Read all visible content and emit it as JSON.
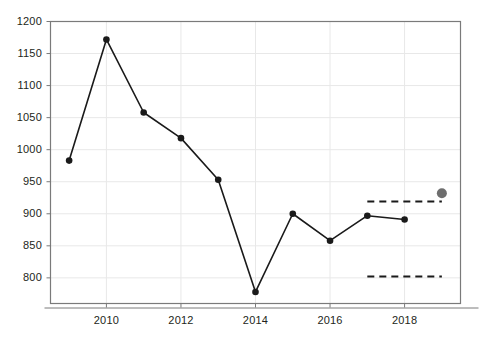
{
  "chart_data": {
    "type": "line",
    "title": "",
    "subtitle": "",
    "xlabel": "",
    "ylabel": "",
    "xlim": [
      2008.5,
      2019.5
    ],
    "ylim": [
      760,
      1200
    ],
    "grid": true,
    "legend_position": "none",
    "x": [
      2009,
      2010,
      2011,
      2012,
      2013,
      2014,
      2015,
      2016,
      2017,
      2018
    ],
    "series": [
      {
        "name": "observed",
        "marker": "circle-filled",
        "color": "#1a1a1a",
        "values": [
          983,
          1172,
          1058,
          1018,
          953,
          778,
          900,
          858,
          897,
          891
        ]
      }
    ],
    "extra_points": [
      {
        "name": "projection-point",
        "x": 2019,
        "y": 932,
        "color": "#6e6e6e",
        "marker": "circle-filled-large"
      }
    ],
    "reference_lines": [
      {
        "name": "upper-threshold",
        "y": 919,
        "x_start": 2017,
        "x_end": 2019,
        "style": "dashed",
        "color": "#1a1a1a"
      },
      {
        "name": "lower-threshold",
        "y": 802,
        "x_start": 2017,
        "x_end": 2019,
        "style": "dashed",
        "color": "#1a1a1a"
      }
    ],
    "yticks": [
      800,
      850,
      900,
      950,
      1000,
      1050,
      1100,
      1150,
      1200
    ],
    "ytick_labels": [
      "800",
      "850",
      "900",
      "950",
      "1000",
      "1050",
      "1100",
      "1150",
      "1200"
    ],
    "xticks": [
      2010,
      2012,
      2014,
      2016,
      2018
    ],
    "xtick_labels": [
      "2010",
      "2012",
      "2014",
      "2016",
      "2018"
    ],
    "colors": {
      "line": "#1a1a1a",
      "marker": "#1a1a1a",
      "projection": "#6e6e6e",
      "grid": "#e8e8e8",
      "axis": "#7a7a7a",
      "text": "#231f20",
      "background": "#ffffff"
    }
  }
}
